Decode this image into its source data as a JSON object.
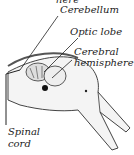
{
  "diagram": {
    "labels": {
      "top_partial": "here",
      "cerebellum": "Cerebellum",
      "optic_lobe": "Optic lobe",
      "cerebral_1": "Cerebral",
      "cerebral_2": "hemisphere",
      "spinal_1": "Spinal",
      "spinal_2": "cord"
    }
  }
}
